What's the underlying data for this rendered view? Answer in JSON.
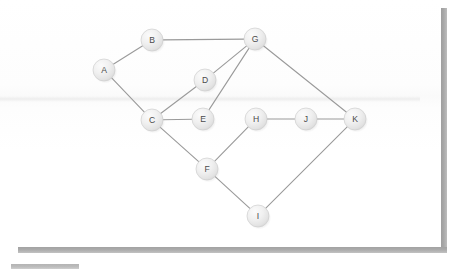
{
  "canvas": {
    "width": 443,
    "height": 252,
    "background_color": "#ffffff",
    "panel_color": "#fdfdfd"
  },
  "chrome": {
    "right_edge_bar": {
      "name": "right-shadow-bar",
      "color": "#a8a8a8"
    },
    "bottom_edge_bar": {
      "name": "bottom-shadow-bar",
      "color": "#ababab"
    },
    "bottom_left_handle": {
      "name": "scroll-handle",
      "color": "#bcbcbc"
    }
  },
  "graph": {
    "title": "",
    "directed": false,
    "node_radius": 11,
    "node_fill": "#ededed",
    "node_stroke": "#cfcfcf",
    "node_label_color": "#4a4a4a",
    "edge_color": "#9a9a9a",
    "nodes": [
      {
        "id": "A",
        "label": "A",
        "x": 104,
        "y": 70
      },
      {
        "id": "B",
        "label": "B",
        "x": 152,
        "y": 40
      },
      {
        "id": "C",
        "label": "C",
        "x": 152,
        "y": 120
      },
      {
        "id": "D",
        "label": "D",
        "x": 205,
        "y": 80
      },
      {
        "id": "E",
        "label": "E",
        "x": 203,
        "y": 119
      },
      {
        "id": "F",
        "label": "F",
        "x": 207,
        "y": 169
      },
      {
        "id": "G",
        "label": "G",
        "x": 255,
        "y": 39
      },
      {
        "id": "H",
        "label": "H",
        "x": 256,
        "y": 119
      },
      {
        "id": "I",
        "label": "I",
        "x": 258,
        "y": 216
      },
      {
        "id": "J",
        "label": "J",
        "x": 306,
        "y": 119
      },
      {
        "id": "K",
        "label": "K",
        "x": 355,
        "y": 119
      }
    ],
    "edges": [
      {
        "source": "A",
        "target": "B"
      },
      {
        "source": "A",
        "target": "C"
      },
      {
        "source": "B",
        "target": "G"
      },
      {
        "source": "C",
        "target": "D"
      },
      {
        "source": "C",
        "target": "E"
      },
      {
        "source": "C",
        "target": "F"
      },
      {
        "source": "D",
        "target": "G"
      },
      {
        "source": "E",
        "target": "G"
      },
      {
        "source": "F",
        "target": "H"
      },
      {
        "source": "F",
        "target": "I"
      },
      {
        "source": "G",
        "target": "K"
      },
      {
        "source": "H",
        "target": "J"
      },
      {
        "source": "I",
        "target": "K"
      },
      {
        "source": "J",
        "target": "K"
      }
    ]
  }
}
